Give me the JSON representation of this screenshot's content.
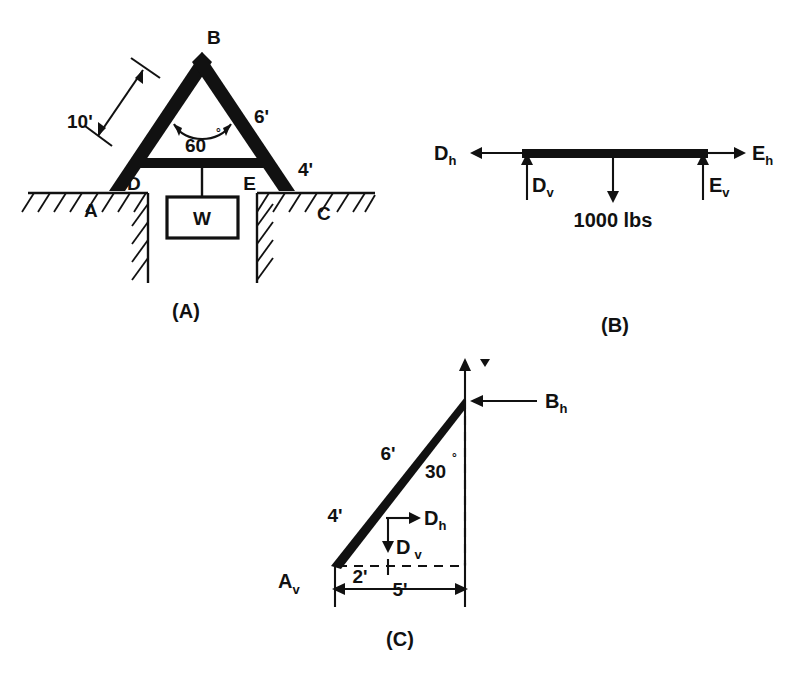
{
  "figure": {
    "title_visible": false,
    "panels": [
      {
        "id": "A",
        "caption": "(A)",
        "description": "A-frame truss resting on ground with load W suspended from beam DE",
        "point_labels": [
          "A",
          "B",
          "C",
          "D",
          "E"
        ],
        "dimensions": [
          {
            "label": "10'",
            "member": "A-B"
          },
          {
            "label": "6'",
            "member": "B-E"
          },
          {
            "label": "4'",
            "member": "E-C"
          }
        ],
        "angle": {
          "label": "60",
          "degree_symbol": "°",
          "vertex": "B"
        },
        "load_box_label": "W"
      },
      {
        "id": "B",
        "caption": "(B)",
        "description": "Free body diagram of beam DE with applied load and reactions",
        "forces": [
          {
            "base": "D",
            "sub": "h",
            "direction": "left"
          },
          {
            "base": "D",
            "sub": "v",
            "direction": "up"
          },
          {
            "base": "E",
            "sub": "h",
            "direction": "right"
          },
          {
            "base": "E",
            "sub": "v",
            "direction": "up"
          }
        ],
        "applied_load": {
          "label": "1000 lbs",
          "magnitude": 1000,
          "units": "lbs",
          "direction": "down"
        }
      },
      {
        "id": "C",
        "caption": "(C)",
        "description": "Free body diagram of member A-B showing reactions and dimensions",
        "forces": [
          {
            "base": "B",
            "sub": "h",
            "direction": "left"
          },
          {
            "base": "D",
            "sub": "h",
            "direction": "right"
          },
          {
            "base": "D",
            "sub": "v",
            "direction": "down"
          },
          {
            "base": "A",
            "sub": "v",
            "direction": "up"
          }
        ],
        "dimensions": [
          {
            "label": "6'",
            "member": "D-B"
          },
          {
            "label": "4'",
            "member": "A-D"
          },
          {
            "label": "2'",
            "member": "A-D horizontal projection"
          },
          {
            "label": "5'",
            "member": "A-B horizontal projection"
          }
        ],
        "angle": {
          "label": "30",
          "degree_symbol": "°",
          "vertex": "B"
        }
      }
    ]
  },
  "colors": {
    "ink": "#111111",
    "paper": "#ffffff"
  }
}
